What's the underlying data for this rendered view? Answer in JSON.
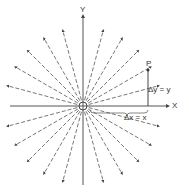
{
  "diagram": {
    "title": "",
    "axes": {
      "x_label": "X",
      "y_label": "Y"
    },
    "point_label": "P",
    "dy_label": "Δy = y",
    "dx_label": "Δx = x",
    "colors": {
      "line": "#444444",
      "background": "#ffffff"
    }
  }
}
